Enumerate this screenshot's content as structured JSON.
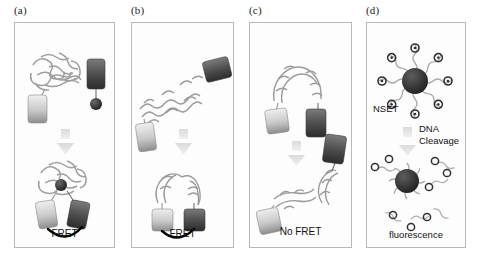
{
  "figure": {
    "background": "#ffffff",
    "arrow_color": "#cfcfcf",
    "tag_light_color": "#d8d8d8",
    "tag_dark_color": "#4a4a4a",
    "protein_color": "#9a9a9a",
    "nanoparticle_color": "#333333",
    "fret_arc_color": "#000000"
  },
  "panels": [
    {
      "id": "a",
      "label": "(a)",
      "caption": "FRET",
      "top_state": "protein with donor tag, separate acceptor tag tethered to ligand sphere",
      "bottom_state": "ligand bound in protein, tags adjacent with energy transfer arc",
      "has_fret_arc": true
    },
    {
      "id": "b",
      "label": "(b)",
      "caption": "FRET",
      "top_state": "extended helical protein with tags at both ends",
      "bottom_state": "folded hairpin bringing both tags together",
      "has_fret_arc": true
    },
    {
      "id": "c",
      "label": "(c)",
      "caption": "No FRET",
      "top_state": "intact protein with both tags close together",
      "bottom_state": "cleaved fragments with tags far apart",
      "has_fret_arc": false
    },
    {
      "id": "d",
      "label": "(d)",
      "caption": "fluorescence",
      "nset_label": "NSET",
      "arrow_label": "DNA\nCleavage",
      "top_state": "gold nanoparticle with eight dye-labeled DNA strands, fluorescence quenched",
      "bottom_state": "dye-labeled fragments released from nanoparticle, fluorescing",
      "has_fret_arc": false
    }
  ]
}
